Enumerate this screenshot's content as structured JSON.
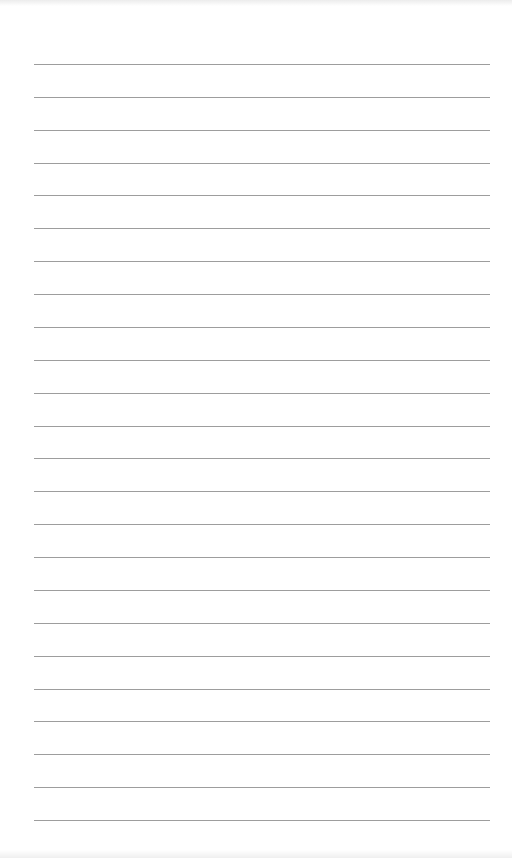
{
  "page": {
    "type": "lined-paper",
    "background_color": "#ffffff",
    "rule_color": "#8c8c8c",
    "rule_count": 24,
    "first_rule_y": 64,
    "rule_spacing": 32.87,
    "rule_left": 34,
    "rule_width": 456
  }
}
